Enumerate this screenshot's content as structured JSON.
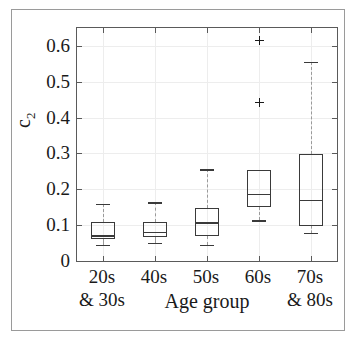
{
  "chart_data": {
    "type": "box",
    "title": "",
    "xlabel": "Age group",
    "ylabel": "c_2",
    "ylabel_base": "c",
    "ylabel_sub": "2",
    "ylim": [
      0,
      0.65
    ],
    "yticks": [
      0,
      0.1,
      0.2,
      0.3,
      0.4,
      0.5,
      0.6
    ],
    "ytick_labels": [
      "0",
      "0.1",
      "0.2",
      "0.3",
      "0.4",
      "0.5",
      "0.6"
    ],
    "grid": true,
    "legend": null,
    "categories": [
      "20s & 30s",
      "40s",
      "50s",
      "60s",
      "70s & 80s"
    ],
    "category_lines": [
      [
        "20s",
        "& 30s"
      ],
      [
        "40s",
        ""
      ],
      [
        "50s",
        ""
      ],
      [
        "60s",
        ""
      ],
      [
        "70s",
        "& 80s"
      ]
    ],
    "boxes": [
      {
        "category": "20s & 30s",
        "whisker_low": 0.046,
        "q1": 0.061,
        "median": 0.072,
        "q3": 0.11,
        "whisker_high": 0.16,
        "outliers": []
      },
      {
        "category": "40s",
        "whisker_low": 0.05,
        "q1": 0.068,
        "median": 0.082,
        "q3": 0.11,
        "whisker_high": 0.164,
        "outliers": []
      },
      {
        "category": "50s",
        "whisker_low": 0.045,
        "q1": 0.071,
        "median": 0.108,
        "q3": 0.147,
        "whisker_high": 0.256,
        "outliers": []
      },
      {
        "category": "60s",
        "whisker_low": 0.113,
        "q1": 0.152,
        "median": 0.188,
        "q3": 0.253,
        "whisker_high": 0.253,
        "outliers": [
          0.443,
          0.615
        ]
      },
      {
        "category": "70s & 80s",
        "whisker_low": 0.079,
        "q1": 0.099,
        "median": 0.171,
        "q3": 0.298,
        "whisker_high": 0.556,
        "outliers": []
      }
    ],
    "colors": {
      "box_edge": "#3a3a3a",
      "median": "#3a3a3a",
      "whisker": "#9a9a9a",
      "outlier": "#1a1a1a",
      "axis": "#5a5a5a",
      "grid": "#ededed",
      "background": "#ffffff",
      "frame": "#9a9a9a"
    }
  }
}
